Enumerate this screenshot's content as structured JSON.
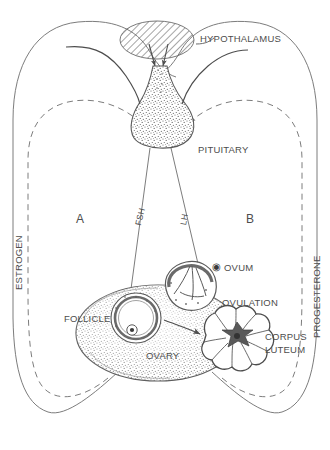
{
  "diagram": {
    "type": "biological-feedback-diagram",
    "background_color": "#ffffff",
    "stroke_color": "#4d4d4d",
    "text_color": "#4d4d4d"
  },
  "labels": {
    "hypothalamus": "HYPOTHALAMUS",
    "pituitary": "PITUITARY",
    "fsh": "FSH",
    "lh": "LH",
    "ovum": "OVUM",
    "ovulation": "OVULATION",
    "follicle": "FOLLICLE",
    "ovary": "OVARY",
    "corpus_luteum_line1": "CORPUS",
    "corpus_luteum_line2": "LUTEUM",
    "estrogen": "ESTROGEN",
    "progesterone": "PROGESTERONE",
    "phase_a": "A",
    "phase_b": "B"
  },
  "icons": {
    "ovum_symbol": "◉"
  },
  "structures": [
    {
      "name": "hypothalamus",
      "fill": "diagonal-hatch"
    },
    {
      "name": "pituitary",
      "fill": "stipple"
    },
    {
      "name": "ovary",
      "fill": "stipple"
    },
    {
      "name": "follicle",
      "fill": "ring-with-ovum"
    },
    {
      "name": "ruptured-follicle",
      "fill": "ovulation-burst"
    },
    {
      "name": "corpus-luteum",
      "fill": "convoluted-lobes"
    }
  ],
  "pathways": [
    {
      "name": "fsh-pathway",
      "from": "pituitary",
      "to": "follicle",
      "style": "solid"
    },
    {
      "name": "lh-pathway",
      "from": "pituitary",
      "to": "ovum",
      "style": "solid-arrow"
    },
    {
      "name": "estrogen-feedback-hypothalamus",
      "from": "follicle",
      "to": "hypothalamus",
      "style": "solid-loop"
    },
    {
      "name": "estrogen-feedback-pituitary",
      "from": "follicle",
      "to": "pituitary",
      "style": "dashed-loop"
    },
    {
      "name": "progesterone-feedback-hypothalamus",
      "from": "corpus-luteum",
      "to": "hypothalamus",
      "style": "solid-loop"
    },
    {
      "name": "progesterone-feedback-pituitary",
      "from": "corpus-luteum",
      "to": "pituitary",
      "style": "dashed-loop"
    },
    {
      "name": "follicle-to-corpus-luteum",
      "from": "follicle",
      "to": "corpus-luteum",
      "style": "solid-arrow"
    }
  ]
}
